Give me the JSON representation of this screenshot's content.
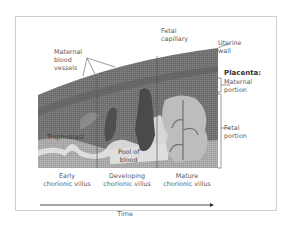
{
  "labels": {
    "maternal_blood_vessels": [
      "Maternal",
      "blood",
      "vessels"
    ],
    "fetal_capillary": [
      "Fetal",
      "capillary"
    ],
    "uterine_wall": [
      "Uterine",
      "wall"
    ],
    "placenta": "Placenta:",
    "maternal_portion": [
      "Maternal",
      "portion"
    ],
    "fetal_portion": [
      "Fetal",
      "portion"
    ],
    "trophoblast": "Trophoblast",
    "pool_of_blood": [
      "Pool of",
      "blood"
    ]
  },
  "stages": [
    {
      "line1": "Early",
      "line2": "chorionic villus"
    },
    {
      "line1": "Developing",
      "line2": "chorionic villus"
    },
    {
      "line1": "Mature",
      "line2": "chorionic villus"
    }
  ],
  "axis": {
    "label": "Time"
  },
  "colors": {
    "frame": "#cfcfcf",
    "tissue_dark": "#5f5f5f",
    "tissue_mid": "#7a7a7a",
    "tissue_light": "#9a9a9a",
    "pale": "#e6e6e6"
  }
}
